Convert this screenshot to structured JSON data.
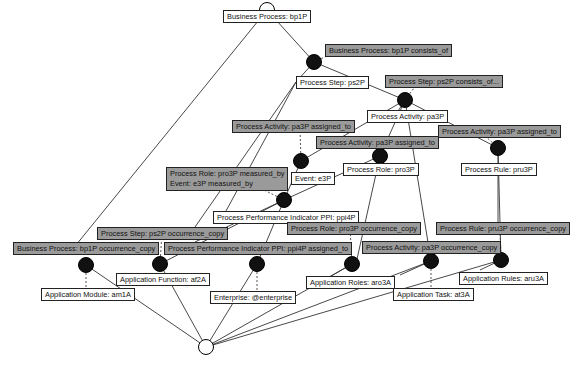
{
  "diagram": {
    "type": "concept-lattice",
    "top_node": {
      "x": 267,
      "y": 10,
      "style": "half-filled"
    },
    "bottom_node": {
      "x": 206,
      "y": 347,
      "style": "empty"
    },
    "relation_nodes": [
      {
        "id": "r1",
        "x": 314,
        "y": 62
      },
      {
        "id": "r2",
        "x": 405,
        "y": 100
      },
      {
        "id": "r3",
        "x": 301,
        "y": 161
      },
      {
        "id": "r4",
        "x": 380,
        "y": 156
      },
      {
        "id": "r5",
        "x": 498,
        "y": 148
      },
      {
        "id": "r6",
        "x": 284,
        "y": 200
      },
      {
        "id": "r7",
        "x": 86,
        "y": 265
      },
      {
        "id": "r8",
        "x": 160,
        "y": 264
      },
      {
        "id": "r9",
        "x": 257,
        "y": 264
      },
      {
        "id": "r10",
        "x": 352,
        "y": 264
      },
      {
        "id": "r11",
        "x": 431,
        "y": 261
      },
      {
        "id": "r12",
        "x": 501,
        "y": 260
      }
    ],
    "labels": [
      {
        "id": "l-bp1P",
        "kind": "concept",
        "text": "Business Process: bp1P",
        "x": 223,
        "y": 10
      },
      {
        "id": "l-bp1P-consists",
        "kind": "relation",
        "text": "Business Process: bp1P consists_of",
        "x": 325,
        "y": 44
      },
      {
        "id": "l-ps2P",
        "kind": "concept",
        "text": "Process Step: ps2P",
        "x": 296,
        "y": 76
      },
      {
        "id": "l-ps2P-consists",
        "kind": "relation",
        "text": "Process Step: ps2P consists_of...",
        "x": 385,
        "y": 75
      },
      {
        "id": "l-pa3P",
        "kind": "concept",
        "text": "Process Activity: pa3P",
        "x": 367,
        "y": 110
      },
      {
        "id": "l-pa3P-assigned-1",
        "kind": "relation",
        "text": "Process Activity: pa3P assigned_to",
        "x": 232,
        "y": 120
      },
      {
        "id": "l-pa3P-assigned-2",
        "kind": "relation",
        "text": "Process Activity: pa3P assigned_to",
        "x": 438,
        "y": 125
      },
      {
        "id": "l-pa3P-assigned-3",
        "kind": "relation",
        "text": "Process Activity: pa3P assigned_to",
        "x": 316,
        "y": 136
      },
      {
        "id": "l-pru3P",
        "kind": "concept",
        "text": "Process Rule: pru3P",
        "x": 461,
        "y": 163
      },
      {
        "id": "l-pro3P",
        "kind": "concept",
        "text": "Process Role: pro3P",
        "x": 343,
        "y": 163
      },
      {
        "id": "l-e3P",
        "kind": "concept",
        "text": "Event: e3P",
        "x": 291,
        "y": 172
      },
      {
        "id": "l-measured",
        "kind": "relation",
        "text": "Process Role: pro3P measured_by\nEvent: e3P measured_by",
        "x": 166,
        "y": 167
      },
      {
        "id": "l-ppi4P",
        "kind": "concept",
        "text": "Process Performance Indicator PPI: ppi4P",
        "x": 213,
        "y": 211
      },
      {
        "id": "l-pro3P-occ",
        "kind": "relation",
        "text": "Process Role: pro3P occurrence_copy",
        "x": 287,
        "y": 222
      },
      {
        "id": "l-pru3P-occ",
        "kind": "relation",
        "text": "Process Rule: pru3P occurrence_copy",
        "x": 436,
        "y": 222
      },
      {
        "id": "l-ps2P-occ",
        "kind": "relation",
        "text": "Process Step: ps2P occurrence_copy",
        "x": 97,
        "y": 227
      },
      {
        "id": "l-bp1P-occ",
        "kind": "relation",
        "text": "Business Process: bp1P occurrence_copy",
        "x": 13,
        "y": 242
      },
      {
        "id": "l-ppi4P-assigned",
        "kind": "relation",
        "text": "Process Performance Indicator PPI: ppi4P assigned_to",
        "x": 164,
        "y": 242
      },
      {
        "id": "l-pa3P-occ",
        "kind": "relation",
        "text": "Process Activity: pa3P occurrence_copy",
        "x": 362,
        "y": 241
      },
      {
        "id": "l-af2A",
        "kind": "concept",
        "text": "Application Function: af2A",
        "x": 116,
        "y": 273
      },
      {
        "id": "l-aru3A",
        "kind": "concept",
        "text": "Application Rules: aru3A",
        "x": 459,
        "y": 272
      },
      {
        "id": "l-aro3A",
        "kind": "concept",
        "text": "Application Roles: aro3A",
        "x": 306,
        "y": 276
      },
      {
        "id": "l-am1A",
        "kind": "concept",
        "text": "Application Module: am1A",
        "x": 41,
        "y": 288
      },
      {
        "id": "l-at3A",
        "kind": "concept",
        "text": "Application Task: at3A",
        "x": 393,
        "y": 288
      },
      {
        "id": "l-enterprise",
        "kind": "concept",
        "text": "Enterprise: @enterprise",
        "x": 210,
        "y": 291
      }
    ],
    "edges": [
      [
        267,
        10,
        314,
        62
      ],
      [
        267,
        10,
        76,
        245
      ],
      [
        314,
        62,
        405,
        100
      ],
      [
        314,
        62,
        296,
        82
      ],
      [
        296,
        82,
        195,
        227
      ],
      [
        296,
        82,
        220,
        222
      ],
      [
        405,
        100,
        395,
        116
      ],
      [
        405,
        100,
        498,
        148
      ],
      [
        405,
        100,
        380,
        156
      ],
      [
        405,
        100,
        301,
        161
      ],
      [
        405,
        100,
        431,
        261
      ],
      [
        380,
        156,
        355,
        268
      ],
      [
        301,
        161,
        284,
        200
      ],
      [
        380,
        156,
        284,
        200
      ],
      [
        498,
        148,
        498,
        222
      ],
      [
        498,
        148,
        501,
        260
      ],
      [
        284,
        200,
        257,
        264
      ],
      [
        284,
        200,
        195,
        242
      ],
      [
        284,
        200,
        160,
        264
      ],
      [
        86,
        265,
        206,
        347
      ],
      [
        160,
        264,
        206,
        347
      ],
      [
        257,
        264,
        206,
        347
      ],
      [
        352,
        264,
        206,
        347
      ],
      [
        431,
        261,
        206,
        347
      ],
      [
        501,
        260,
        206,
        347
      ],
      [
        352,
        264,
        326,
        279
      ],
      [
        431,
        261,
        400,
        275
      ],
      [
        501,
        260,
        480,
        270
      ]
    ],
    "dashed_edges": [
      [
        314,
        62,
        340,
        50
      ],
      [
        405,
        100,
        420,
        80
      ],
      [
        301,
        161,
        300,
        128
      ],
      [
        380,
        156,
        378,
        142
      ],
      [
        498,
        148,
        480,
        131
      ],
      [
        284,
        200,
        240,
        178
      ],
      [
        86,
        265,
        86,
        290
      ],
      [
        160,
        264,
        162,
        232
      ],
      [
        257,
        264,
        257,
        292
      ],
      [
        352,
        264,
        350,
        228
      ],
      [
        431,
        261,
        431,
        290
      ],
      [
        501,
        260,
        500,
        228
      ]
    ],
    "colors": {
      "relation_fill": "#9a9a9a",
      "concept_fill": "#ffffff",
      "node_fill": "#111111",
      "edge": "#333333"
    }
  }
}
